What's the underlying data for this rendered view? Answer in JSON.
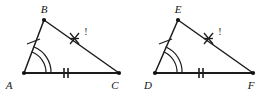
{
  "figure": {
    "kind": "geometry-diagram",
    "background_color": "#ffffff",
    "stroke_color": "#1c1c1c",
    "label_color": "#141414",
    "triangles": [
      {
        "id": "triangle-abc",
        "name": "Triangle ABC",
        "vertices": [
          {
            "id": "A",
            "label": "A",
            "x": 24,
            "y": 73,
            "label_x": 9,
            "label_y": 88
          },
          {
            "id": "B",
            "label": "B",
            "x": 44,
            "y": 20,
            "label_x": 42,
            "label_y": 12
          },
          {
            "id": "C",
            "label": "C",
            "x": 119,
            "y": 73,
            "label_x": 113,
            "label_y": 88
          }
        ],
        "sides": [
          {
            "id": "AB",
            "from": "A",
            "to": "B",
            "ticks": 1,
            "tick_style": "slash"
          },
          {
            "id": "AC",
            "from": "A",
            "to": "C",
            "ticks": 2,
            "tick_style": "bar"
          },
          {
            "id": "BC",
            "from": "B",
            "to": "C",
            "ticks": 3,
            "tick_style": "cross"
          }
        ],
        "angle_marks": [
          {
            "at": "A",
            "arcs": 2,
            "style": "double-arc"
          }
        ],
        "side_annotation": {
          "text": "!",
          "x": 82,
          "y": 34
        }
      },
      {
        "id": "triangle-def",
        "name": "Triangle DEF",
        "vertices": [
          {
            "id": "D",
            "label": "D",
            "x": 155,
            "y": 73,
            "label_x": 142,
            "label_y": 88
          },
          {
            "id": "E",
            "label": "E",
            "x": 178,
            "y": 20,
            "label_x": 175,
            "label_y": 12
          },
          {
            "id": "F",
            "label": "F",
            "x": 253,
            "y": 73,
            "label_x": 248,
            "label_y": 88
          }
        ],
        "sides": [
          {
            "id": "DE",
            "from": "D",
            "to": "E",
            "ticks": 1,
            "tick_style": "slash"
          },
          {
            "id": "DF",
            "from": "D",
            "to": "F",
            "ticks": 2,
            "tick_style": "bar"
          },
          {
            "id": "EF",
            "from": "E",
            "to": "F",
            "ticks": 3,
            "tick_style": "cross"
          }
        ],
        "angle_marks": [
          {
            "at": "D",
            "arcs": 2,
            "style": "double-arc"
          }
        ],
        "side_annotation": {
          "text": "!",
          "x": 216,
          "y": 34
        }
      }
    ]
  },
  "labels": {
    "a": "A",
    "b": "B",
    "c": "C",
    "d": "D",
    "e": "E",
    "f": "F",
    "annotation_left": "!",
    "annotation_right": "!"
  }
}
